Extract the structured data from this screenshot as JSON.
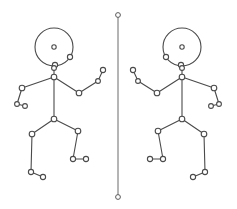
{
  "canvas": {
    "width": 237,
    "height": 209,
    "background": "#ffffff",
    "title": "Mirrored stick figure skeleton diagram"
  },
  "style": {
    "bone_color": "#4a4a4a",
    "joint_fill": "#ffffff",
    "joint_stroke": "#4a4a4a",
    "axis_color": "#6b6b6b",
    "bone_width": 1.1,
    "joint_radius": 2.6,
    "small_joint_radius": 2.0
  },
  "mirror_axis": {
    "name": "mirror-axis",
    "x": 118,
    "y_top": 15,
    "y_bottom": 197,
    "endpoint_radius": 2.4,
    "color": "#6b6b6b"
  },
  "figures": [
    {
      "id": "figure-left",
      "label": "Left stick figure",
      "head": {
        "cx": 54,
        "cy": 47,
        "r": 19,
        "pupil_r": 2.2
      },
      "joints": [
        {
          "name": "head-center",
          "x": 54,
          "y": 47,
          "r": 2.2
        },
        {
          "name": "head-node-right",
          "x": 70,
          "y": 57,
          "r": 2.6
        },
        {
          "name": "head-node-bottom",
          "x": 55,
          "y": 65,
          "r": 2.6
        },
        {
          "name": "neck",
          "x": 54,
          "y": 68,
          "r": 2.4
        },
        {
          "name": "chest",
          "x": 54,
          "y": 77,
          "r": 2.8
        },
        {
          "name": "shoulder-left",
          "x": 22,
          "y": 88,
          "r": 2.8
        },
        {
          "name": "elbow-left",
          "x": 17,
          "y": 104,
          "r": 2.4
        },
        {
          "name": "hand-left",
          "x": 25,
          "y": 106,
          "r": 2.4
        },
        {
          "name": "elbow-right",
          "x": 79,
          "y": 93,
          "r": 2.8
        },
        {
          "name": "wrist-right",
          "x": 98,
          "y": 81,
          "r": 2.4
        },
        {
          "name": "hand-right",
          "x": 103,
          "y": 70,
          "r": 2.6
        },
        {
          "name": "hip-center",
          "x": 54,
          "y": 119,
          "r": 2.8
        },
        {
          "name": "knee-left",
          "x": 32,
          "y": 134,
          "r": 2.8
        },
        {
          "name": "ankle-left",
          "x": 31,
          "y": 172,
          "r": 2.6
        },
        {
          "name": "toe-left",
          "x": 43,
          "y": 177,
          "r": 2.6
        },
        {
          "name": "knee-right",
          "x": 78,
          "y": 131,
          "r": 2.8
        },
        {
          "name": "ankle-right",
          "x": 73,
          "y": 159,
          "r": 2.6
        },
        {
          "name": "toe-right",
          "x": 86,
          "y": 159,
          "r": 2.6
        }
      ],
      "bones": [
        {
          "name": "neck-to-chest",
          "from": "neck",
          "to": "chest"
        },
        {
          "name": "chest-to-shoulder-l",
          "from": "chest",
          "to": "shoulder-left"
        },
        {
          "name": "shoulder-l-to-elbow-l",
          "from": "shoulder-left",
          "to": "elbow-left"
        },
        {
          "name": "elbow-l-to-hand-l",
          "from": "elbow-left",
          "to": "hand-left"
        },
        {
          "name": "chest-to-elbow-r",
          "from": "chest",
          "to": "elbow-right"
        },
        {
          "name": "elbow-r-to-wrist-r",
          "from": "elbow-right",
          "to": "wrist-right"
        },
        {
          "name": "wrist-r-to-hand-r",
          "from": "wrist-right",
          "to": "hand-right"
        },
        {
          "name": "spine",
          "from": "chest",
          "to": "hip-center"
        },
        {
          "name": "hip-to-knee-l",
          "from": "hip-center",
          "to": "knee-left"
        },
        {
          "name": "knee-l-to-ankle-l",
          "from": "knee-left",
          "to": "ankle-left"
        },
        {
          "name": "ankle-l-to-toe-l",
          "from": "ankle-left",
          "to": "toe-left"
        },
        {
          "name": "hip-to-knee-r",
          "from": "hip-center",
          "to": "knee-right"
        },
        {
          "name": "knee-r-to-ankle-r",
          "from": "knee-right",
          "to": "ankle-right"
        },
        {
          "name": "ankle-r-to-toe-r",
          "from": "ankle-right",
          "to": "toe-right"
        }
      ]
    },
    {
      "id": "figure-right",
      "label": "Right stick figure (mirrored)",
      "mirrored_from": "figure-left",
      "mirror_x": 118,
      "head": {
        "cx": 182,
        "cy": 47,
        "r": 19,
        "pupil_r": 2.2
      },
      "joints": [
        {
          "name": "head-center",
          "x": 182,
          "y": 47,
          "r": 2.2
        },
        {
          "name": "head-node-left",
          "x": 166,
          "y": 57,
          "r": 2.6
        },
        {
          "name": "head-node-bottom",
          "x": 181,
          "y": 65,
          "r": 2.6
        },
        {
          "name": "neck",
          "x": 182,
          "y": 68,
          "r": 2.4
        },
        {
          "name": "chest",
          "x": 182,
          "y": 77,
          "r": 2.8
        },
        {
          "name": "shoulder-right",
          "x": 214,
          "y": 88,
          "r": 2.8
        },
        {
          "name": "elbow-right",
          "x": 219,
          "y": 104,
          "r": 2.4
        },
        {
          "name": "hand-right",
          "x": 211,
          "y": 106,
          "r": 2.4
        },
        {
          "name": "elbow-left",
          "x": 157,
          "y": 93,
          "r": 2.8
        },
        {
          "name": "wrist-left",
          "x": 138,
          "y": 81,
          "r": 2.4
        },
        {
          "name": "hand-left",
          "x": 133,
          "y": 70,
          "r": 2.6
        },
        {
          "name": "hip-center",
          "x": 182,
          "y": 119,
          "r": 2.8
        },
        {
          "name": "knee-right",
          "x": 204,
          "y": 134,
          "r": 2.8
        },
        {
          "name": "ankle-right",
          "x": 205,
          "y": 172,
          "r": 2.6
        },
        {
          "name": "toe-right",
          "x": 193,
          "y": 177,
          "r": 2.6
        },
        {
          "name": "knee-left",
          "x": 158,
          "y": 131,
          "r": 2.8
        },
        {
          "name": "ankle-left",
          "x": 163,
          "y": 159,
          "r": 2.6
        },
        {
          "name": "toe-left",
          "x": 150,
          "y": 159,
          "r": 2.6
        }
      ],
      "bones": [
        {
          "name": "neck-to-chest",
          "from": "neck",
          "to": "chest"
        },
        {
          "name": "chest-to-shoulder-r",
          "from": "chest",
          "to": "shoulder-right"
        },
        {
          "name": "shoulder-r-to-elbow-r",
          "from": "shoulder-right",
          "to": "elbow-right"
        },
        {
          "name": "elbow-r-to-hand-r",
          "from": "elbow-right",
          "to": "hand-right"
        },
        {
          "name": "chest-to-elbow-l",
          "from": "chest",
          "to": "elbow-left"
        },
        {
          "name": "elbow-l-to-wrist-l",
          "from": "elbow-left",
          "to": "wrist-left"
        },
        {
          "name": "wrist-l-to-hand-l",
          "from": "wrist-left",
          "to": "hand-left"
        },
        {
          "name": "spine",
          "from": "chest",
          "to": "hip-center"
        },
        {
          "name": "hip-to-knee-r",
          "from": "hip-center",
          "to": "knee-right"
        },
        {
          "name": "knee-r-to-ankle-r",
          "from": "knee-right",
          "to": "ankle-right"
        },
        {
          "name": "ankle-r-to-toe-r",
          "from": "ankle-right",
          "to": "toe-right"
        },
        {
          "name": "hip-to-knee-l",
          "from": "hip-center",
          "to": "knee-left"
        },
        {
          "name": "knee-l-to-ankle-l",
          "from": "knee-left",
          "to": "ankle-left"
        },
        {
          "name": "ankle-l-to-toe-l",
          "from": "ankle-left",
          "to": "toe-left"
        }
      ]
    }
  ]
}
